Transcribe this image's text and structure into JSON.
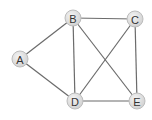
{
  "diagram": {
    "type": "undirected-graph",
    "nodes": [
      {
        "id": "A",
        "label": "A",
        "x": 20,
        "y": 59
      },
      {
        "id": "B",
        "label": "B",
        "x": 73,
        "y": 18
      },
      {
        "id": "C",
        "label": "C",
        "x": 135,
        "y": 19
      },
      {
        "id": "D",
        "label": "D",
        "x": 75,
        "y": 101
      },
      {
        "id": "E",
        "label": "E",
        "x": 137,
        "y": 101
      }
    ],
    "edges": [
      [
        "A",
        "B"
      ],
      [
        "A",
        "D"
      ],
      [
        "B",
        "C"
      ],
      [
        "B",
        "D"
      ],
      [
        "B",
        "E"
      ],
      [
        "C",
        "D"
      ],
      [
        "C",
        "E"
      ],
      [
        "D",
        "E"
      ]
    ],
    "colors": {
      "edge": "#6b6b6b",
      "node_fill": "#e0e0e0",
      "label": "#333333"
    }
  }
}
